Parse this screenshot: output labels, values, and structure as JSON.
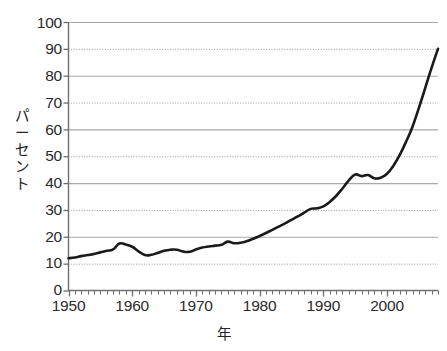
{
  "chart_data": {
    "type": "line",
    "title": "",
    "subtitle": "",
    "xlabel": "年",
    "ylabel": "パーセント",
    "xlim": [
      1950,
      2008
    ],
    "ylim": [
      0,
      100
    ],
    "grid": true,
    "legend": false,
    "legend_position": "none",
    "y_ticks": [
      0,
      10,
      20,
      30,
      40,
      50,
      60,
      70,
      80,
      90,
      100
    ],
    "y_tick_labels": [
      "0",
      "10",
      "20",
      "30",
      "40",
      "50",
      "60",
      "70",
      "80",
      "90",
      "100"
    ],
    "x_ticks": [
      1950,
      1960,
      1970,
      1980,
      1990,
      2000
    ],
    "x_tick_labels": [
      "1950",
      "1960",
      "1970",
      "1980",
      "1990",
      "2000"
    ],
    "x_minor_tick_interval": 1,
    "line_color": "#1a1a1a",
    "line_width": 2.6,
    "gridline_color": "#8c8c8c",
    "gridline_style_alternating": [
      "solid",
      "dotted"
    ],
    "axis_color": "#6e6e6e",
    "series": [
      {
        "name": "パーセント",
        "x": [
          1950,
          1951,
          1952,
          1953,
          1954,
          1955,
          1956,
          1957,
          1958,
          1959,
          1960,
          1961,
          1962,
          1963,
          1964,
          1965,
          1966,
          1967,
          1968,
          1969,
          1970,
          1971,
          1972,
          1973,
          1974,
          1975,
          1976,
          1977,
          1978,
          1979,
          1980,
          1981,
          1982,
          1983,
          1984,
          1985,
          1986,
          1987,
          1988,
          1989,
          1990,
          1991,
          1992,
          1993,
          1994,
          1995,
          1996,
          1997,
          1998,
          1999,
          2000,
          2001,
          2002,
          2003,
          2004,
          2005,
          2006,
          2007,
          2008
        ],
        "values": [
          12.0,
          12.3,
          12.8,
          13.2,
          13.6,
          14.2,
          14.8,
          15.3,
          17.5,
          17.1,
          16.3,
          14.6,
          13.2,
          13.3,
          14.0,
          14.8,
          15.2,
          15.2,
          14.5,
          14.4,
          15.3,
          16.0,
          16.4,
          16.7,
          17.0,
          18.2,
          17.6,
          17.8,
          18.4,
          19.3,
          20.3,
          21.4,
          22.6,
          23.8,
          25.0,
          26.3,
          27.6,
          29.0,
          30.4,
          30.6,
          31.3,
          33.0,
          35.2,
          38.0,
          41.0,
          43.2,
          42.6,
          43.0,
          41.8,
          42.0,
          43.5,
          46.5,
          50.5,
          55.5,
          61.0,
          68.0,
          75.5,
          83.0,
          90.0
        ]
      }
    ]
  },
  "axis": {
    "y_title": "パーセント",
    "x_title": "年",
    "y_title_chars": [
      "パ",
      "ー",
      "セ",
      "ン",
      "ト"
    ]
  }
}
